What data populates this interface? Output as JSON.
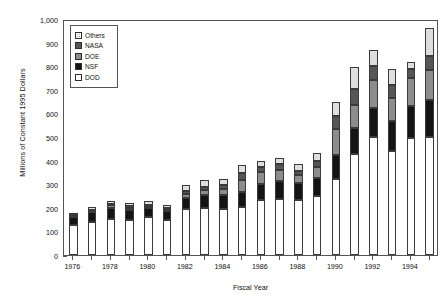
{
  "chart_data": {
    "type": "bar",
    "subtype": "stacked-vertical",
    "title": "",
    "xlabel": "Fiscal Year",
    "ylabel": "Millions of Constant 1995 Dollars",
    "ylim": [
      0,
      1000
    ],
    "ytick_step": 100,
    "ytick_labels": [
      "0",
      "100",
      "200",
      "300",
      "400",
      "500",
      "600",
      "700",
      "800",
      "900",
      "1,000"
    ],
    "ytick_values": [
      0,
      100,
      200,
      300,
      400,
      500,
      600,
      700,
      800,
      900,
      1000
    ],
    "grid": false,
    "legend_position": "top-left-inside",
    "categories": [
      "1976",
      "1977",
      "1978",
      "1979",
      "1980",
      "1981",
      "1982",
      "1983",
      "1984",
      "1985",
      "1986",
      "1987",
      "1988",
      "1989",
      "1990",
      "1991",
      "1992",
      "1993",
      "1994",
      "1995"
    ],
    "xtick_labels": [
      "1976",
      "1978",
      "1980",
      "1982",
      "1984",
      "1986",
      "1988",
      "1990",
      "1992",
      "1994"
    ],
    "xtick_categories": [
      "1976",
      "1978",
      "1980",
      "1982",
      "1984",
      "1986",
      "1988",
      "1990",
      "1992",
      "1994"
    ],
    "series": [
      {
        "name": "DOD",
        "key": "dod",
        "color": "#ffffff",
        "values": [
          128,
          140,
          152,
          150,
          160,
          148,
          196,
          200,
          196,
          205,
          232,
          238,
          232,
          248,
          320,
          430,
          500,
          440,
          496,
          500
        ]
      },
      {
        "name": "NSF",
        "key": "nsf",
        "color": "#141414",
        "values": [
          34,
          42,
          48,
          42,
          40,
          38,
          44,
          54,
          60,
          62,
          70,
          74,
          72,
          78,
          104,
          110,
          124,
          128,
          136,
          156
        ]
      },
      {
        "name": "DOE",
        "key": "doe",
        "color": "#8d8d8d",
        "values": [
          4,
          6,
          10,
          8,
          8,
          8,
          18,
          22,
          24,
          52,
          48,
          50,
          36,
          48,
          110,
          96,
          118,
          98,
          116,
          130
        ]
      },
      {
        "name": "NASA",
        "key": "nasa",
        "color": "#565656",
        "values": [
          4,
          4,
          6,
          6,
          6,
          6,
          12,
          14,
          18,
          28,
          22,
          22,
          18,
          24,
          56,
          68,
          60,
          54,
          40,
          56
        ]
      },
      {
        "name": "Others",
        "key": "others",
        "color": "#dedede",
        "values": [
          10,
          10,
          14,
          14,
          16,
          14,
          26,
          26,
          26,
          36,
          26,
          26,
          26,
          36,
          58,
          92,
          68,
          68,
          32,
          120
        ]
      }
    ],
    "totals": [
      180,
      202,
      230,
      220,
      230,
      214,
      296,
      316,
      324,
      383,
      398,
      410,
      384,
      434,
      648,
      796,
      870,
      788,
      820,
      962
    ]
  },
  "legend": {
    "items": [
      {
        "label": "Others",
        "swatch": "sw-others"
      },
      {
        "label": "NASA",
        "swatch": "sw-nasa"
      },
      {
        "label": "DOE",
        "swatch": "sw-doe"
      },
      {
        "label": "NSF",
        "swatch": "sw-nsf"
      },
      {
        "label": "DOD",
        "swatch": "sw-dod"
      }
    ]
  }
}
